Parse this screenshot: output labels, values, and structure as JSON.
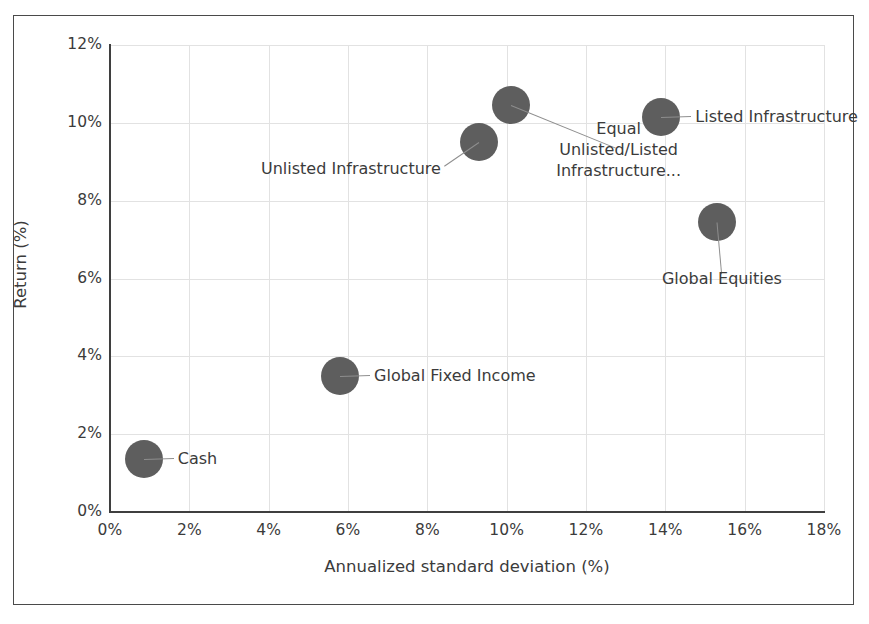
{
  "chart_data": {
    "type": "scatter",
    "title": "",
    "xlabel": "Annualized standard deviation (%)",
    "ylabel": "Return (%)",
    "xlim": [
      0,
      18
    ],
    "ylim": [
      0,
      12
    ],
    "xticks": [
      "0%",
      "2%",
      "4%",
      "6%",
      "8%",
      "10%",
      "12%",
      "14%",
      "16%",
      "18%"
    ],
    "yticks": [
      "0%",
      "2%",
      "4%",
      "6%",
      "8%",
      "10%",
      "12%"
    ],
    "grid": true,
    "legend": "none",
    "marker_color": "#5e5e5e",
    "points": [
      {
        "label": "Cash",
        "x": 0.85,
        "y": 1.35,
        "label_lines": [
          "Cash"
        ],
        "label_align": "left"
      },
      {
        "label": "Global Fixed Income",
        "x": 5.8,
        "y": 3.5,
        "label_lines": [
          "Global Fixed Income"
        ],
        "label_align": "left"
      },
      {
        "label": "Unlisted Infrastructure",
        "x": 9.3,
        "y": 9.5,
        "label_lines": [
          "Unlisted Infrastructure"
        ],
        "label_align": "right"
      },
      {
        "label": "Equal Unlisted/Listed Infrastructure...",
        "x": 10.1,
        "y": 10.45,
        "label_lines": [
          "Equal",
          "Unlisted/Listed",
          "Infrastructure..."
        ],
        "label_align": "center"
      },
      {
        "label": "Listed Infrastructure",
        "x": 13.9,
        "y": 10.15,
        "label_lines": [
          "Listed Infrastructure"
        ],
        "label_align": "left"
      },
      {
        "label": "Global Equities",
        "x": 15.3,
        "y": 7.45,
        "label_lines": [
          "Global Equities"
        ],
        "label_align": "center"
      }
    ]
  },
  "labels": {
    "cash": "Cash",
    "global_fixed_income": "Global Fixed Income",
    "unlisted_infrastructure": "Unlisted Infrastructure",
    "equal_line1": "Equal",
    "equal_line2": "Unlisted/Listed",
    "equal_line3": "Infrastructure...",
    "listed_infrastructure": "Listed Infrastructure",
    "global_equities": "Global Equities"
  },
  "axes": {
    "x_title": "Annualized standard deviation (%)",
    "y_title": "Return (%)",
    "x_ticks": [
      "0%",
      "2%",
      "4%",
      "6%",
      "8%",
      "10%",
      "12%",
      "14%",
      "16%",
      "18%"
    ],
    "y_ticks": [
      "12%",
      "10%",
      "8%",
      "6%",
      "4%",
      "2%",
      "0%"
    ]
  }
}
